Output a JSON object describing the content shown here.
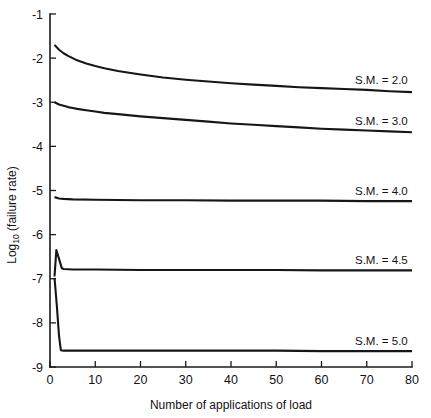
{
  "chart_data": {
    "type": "line",
    "title": "",
    "xlabel": "Number of applications of load",
    "ylabel": "Log10 (failure rate)",
    "ylabel_main": "Log",
    "ylabel_sub": "10",
    "ylabel_rest": " (failure rate)",
    "xlim": [
      0,
      80
    ],
    "ylim": [
      -9,
      -1
    ],
    "grid": false,
    "legend_position": "right-inline",
    "xticks": [
      0,
      10,
      20,
      30,
      40,
      50,
      60,
      70,
      80
    ],
    "xtick_labels": [
      "0",
      "10",
      "20",
      "30",
      "40",
      "50",
      "60",
      "70",
      "80"
    ],
    "yticks": [
      -1,
      -2,
      -3,
      -4,
      -5,
      -6,
      -7,
      -8,
      -9
    ],
    "ytick_labels": [
      "-1",
      "-2",
      "-3",
      "-4",
      "-5",
      "-6",
      "-7",
      "-8",
      "-9"
    ],
    "series": [
      {
        "name": "S.M. = 2.0",
        "label": "S.M. = 2.0",
        "x": [
          1,
          2,
          3,
          4,
          5,
          6,
          8,
          10,
          12,
          15,
          20,
          25,
          30,
          35,
          40,
          45,
          50,
          55,
          60,
          65,
          70,
          75,
          80
        ],
        "values": [
          -1.7,
          -1.81,
          -1.89,
          -1.95,
          -2.0,
          -2.05,
          -2.12,
          -2.18,
          -2.23,
          -2.29,
          -2.37,
          -2.44,
          -2.49,
          -2.53,
          -2.57,
          -2.6,
          -2.63,
          -2.66,
          -2.68,
          -2.7,
          -2.72,
          -2.75,
          -2.77
        ]
      },
      {
        "name": "S.M. = 3.0",
        "label": "S.M. = 3.0",
        "x": [
          1,
          2,
          3,
          4,
          5,
          6,
          8,
          10,
          12,
          15,
          20,
          25,
          30,
          35,
          40,
          45,
          50,
          55,
          60,
          65,
          70,
          75,
          80
        ],
        "values": [
          -3.0,
          -3.05,
          -3.08,
          -3.11,
          -3.13,
          -3.15,
          -3.18,
          -3.21,
          -3.24,
          -3.27,
          -3.32,
          -3.36,
          -3.4,
          -3.44,
          -3.48,
          -3.51,
          -3.54,
          -3.57,
          -3.6,
          -3.62,
          -3.64,
          -3.66,
          -3.68
        ]
      },
      {
        "name": "S.M. = 4.0",
        "label": "S.M. = 4.0",
        "x": [
          1,
          2,
          3,
          5,
          10,
          20,
          30,
          40,
          50,
          60,
          70,
          80
        ],
        "values": [
          -5.15,
          -5.18,
          -5.19,
          -5.2,
          -5.21,
          -5.22,
          -5.22,
          -5.23,
          -5.23,
          -5.23,
          -5.24,
          -5.24
        ]
      },
      {
        "name": "S.M. = 4.5",
        "label": "S.M. = 4.5",
        "x": [
          1,
          1.4,
          2,
          2.6,
          3,
          5,
          10,
          20,
          30,
          40,
          50,
          60,
          70,
          80
        ],
        "values": [
          -6.95,
          -6.35,
          -6.55,
          -6.76,
          -6.78,
          -6.79,
          -6.79,
          -6.8,
          -6.8,
          -6.8,
          -6.8,
          -6.81,
          -6.81,
          -6.81
        ]
      },
      {
        "name": "S.M. = 5.0",
        "label": "S.M. = 5.0",
        "x": [
          1,
          1.5,
          2,
          2.4,
          3,
          5,
          10,
          20,
          30,
          40,
          50,
          60,
          70,
          80
        ],
        "values": [
          -6.98,
          -7.6,
          -8.3,
          -8.62,
          -8.63,
          -8.63,
          -8.63,
          -8.63,
          -8.63,
          -8.63,
          -8.63,
          -8.64,
          -8.64,
          -8.64
        ]
      }
    ],
    "series_label_positions": [
      {
        "label": "S.M. = 2.0",
        "x": 82,
        "y": -2.5
      },
      {
        "label": "S.M. = 3.0",
        "x": 82,
        "y": -3.42
      },
      {
        "label": "S.M. = 4.0",
        "x": 82,
        "y": -5.0
      },
      {
        "label": "S.M. = 4.5",
        "x": 82,
        "y": -6.58
      },
      {
        "label": "S.M. = 5.0",
        "x": 82,
        "y": -8.42
      }
    ]
  }
}
